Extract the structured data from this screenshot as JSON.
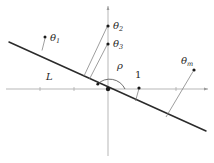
{
  "figure": {
    "type": "geometric-diagram",
    "width": 214,
    "height": 163,
    "background_color": "#ffffff",
    "line_color": "#2b2b2b",
    "axis_color": "#9a9a9a",
    "leader_color": "#7d7d7d"
  },
  "axes": {
    "x_axis": {
      "x1": 6,
      "y1": 89,
      "x2": 208,
      "y2": 89
    },
    "y_axis": {
      "x1": 108,
      "y1": 6,
      "x2": 108,
      "y2": 156
    },
    "ticks": [
      {
        "x": 40,
        "y": 89
      },
      {
        "x": 74,
        "y": 89
      },
      {
        "x": 142,
        "y": 89
      },
      {
        "x": 176,
        "y": 89
      }
    ]
  },
  "line_L": {
    "x1": 9,
    "y1": 42,
    "x2": 206,
    "y2": 131
  },
  "labels": {
    "theta1": {
      "base": "θ",
      "sub": "1",
      "x": 50,
      "y": 40
    },
    "theta2": {
      "base": "θ",
      "sub": "2",
      "x": 113,
      "y": 26
    },
    "theta3": {
      "base": "θ",
      "sub": "3",
      "x": 113,
      "y": 46
    },
    "theta_m": {
      "base": "θ",
      "sub": "m",
      "x": 182,
      "y": 63
    },
    "rho": {
      "base": "ρ",
      "sub": "",
      "x": 118,
      "y": 67
    },
    "one": {
      "base": "1",
      "sub": "",
      "x": 136,
      "y": 74
    },
    "L": {
      "base": "L",
      "sub": "",
      "x": 47,
      "y": 78
    }
  },
  "points": [
    {
      "name": "theta1-point",
      "x": 45,
      "y": 37,
      "r": 1.5
    },
    {
      "name": "theta2-point",
      "x": 108,
      "y": 26,
      "r": 1.6
    },
    {
      "name": "theta3-point",
      "x": 108,
      "y": 44,
      "r": 1.6
    },
    {
      "name": "theta-m-point",
      "x": 194,
      "y": 70,
      "r": 1.6
    },
    {
      "name": "one-point",
      "x": 139,
      "y": 88,
      "r": 1.6
    },
    {
      "name": "origin-point",
      "x": 108,
      "y": 89,
      "r": 2.1
    },
    {
      "name": "arc-start-point",
      "x": 98,
      "y": 84,
      "r": 1.4
    }
  ],
  "leaders": [
    {
      "name": "theta1-leader",
      "x1": 45,
      "y1": 38,
      "x2": 42,
      "y2": 50
    },
    {
      "name": "theta2-leader",
      "x1": 107,
      "y1": 27,
      "x2": 84,
      "y2": 76
    },
    {
      "name": "theta3-leader",
      "x1": 107,
      "y1": 45,
      "x2": 89,
      "y2": 79
    },
    {
      "name": "one-leader",
      "x1": 139,
      "y1": 88,
      "x2": 136,
      "y2": 101
    },
    {
      "name": "theta-m-leader",
      "x1": 193,
      "y1": 71,
      "x2": 166,
      "y2": 117
    }
  ],
  "arc": {
    "name": "rho-angle-arc",
    "cx": 108,
    "cy": 89,
    "r": 17,
    "start_x": 97.5,
    "start_y": 84.4,
    "end_x": 125,
    "end_y": 89
  }
}
